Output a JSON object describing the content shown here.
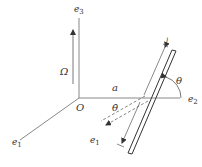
{
  "diagram": {
    "type": "rotating-rod-mechanics",
    "labels": {
      "e3": "e",
      "e3_sub": "3",
      "e2": "e",
      "e2_sub": "2",
      "e1": "e",
      "e1_sub": "1",
      "e1_prime": "e",
      "e1_prime_sub": "1",
      "origin": "O",
      "omega": "Ω",
      "offset": "a",
      "angle": "θ",
      "angle_rate": "θ̇",
      "length_upper": "l",
      "length_lower": "l"
    },
    "colors": {
      "axis": "#888888",
      "rod": "#333333",
      "text": "#333333",
      "background": "#ffffff"
    }
  }
}
